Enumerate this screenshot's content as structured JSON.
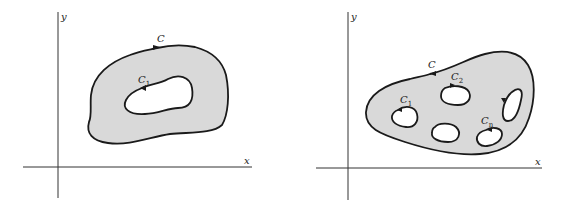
{
  "figures": [
    {
      "id": "left",
      "description": "Region bounded by outer curve C with a single hole bounded by C1 (doubly connected region)",
      "axes": {
        "x_label": "x",
        "y_label": "y"
      },
      "curves": [
        {
          "label": "C",
          "sub": "",
          "role": "outer boundary"
        },
        {
          "label": "C",
          "sub": "1",
          "role": "inner boundary"
        }
      ]
    },
    {
      "id": "right",
      "description": "Region bounded by outer curve C with multiple holes bounded by C1, C2, ..., Cn (multiply connected region)",
      "axes": {
        "x_label": "x",
        "y_label": "y"
      },
      "curves": [
        {
          "label": "C",
          "sub": "",
          "role": "outer boundary"
        },
        {
          "label": "C",
          "sub": "1",
          "role": "inner boundary"
        },
        {
          "label": "C",
          "sub": "2",
          "role": "inner boundary"
        },
        {
          "label": "C",
          "sub": "n",
          "role": "inner boundary"
        }
      ]
    }
  ],
  "colors": {
    "region_fill": "#d9d9d9",
    "stroke": "#1a1a1a",
    "background": "#ffffff"
  }
}
